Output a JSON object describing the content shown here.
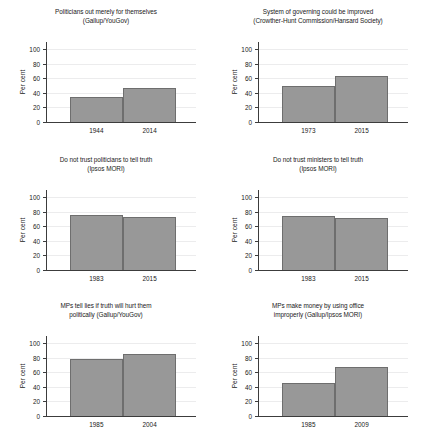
{
  "figure": {
    "axis_label_y": "Per cent",
    "y_ticks": [
      0,
      20,
      40,
      60,
      80,
      100
    ],
    "bar_color": "#989898",
    "bar_edge_color": "#6e6e6e",
    "grid_color": "#ececed",
    "axis_color": "#3c3c3c"
  },
  "chart_data": [
    {
      "type": "bar",
      "title": "Politicians out merely for themselves\n(Gallup/YouGov)",
      "title_line1": "Politicians out merely for themselves",
      "title_line2": "(Gallup/YouGov)",
      "source": "Gallup/YouGov",
      "categories": [
        "1944",
        "2014"
      ],
      "values": [
        35,
        47
      ],
      "xlabel": "",
      "ylabel": "Per cent",
      "ylim": [
        0,
        110
      ],
      "yticks": [
        0,
        20,
        40,
        60,
        80,
        100
      ],
      "grid": true,
      "legend": "none"
    },
    {
      "type": "bar",
      "title": "System of governing could be improved\n(Crowther-Hunt Commission/Hansard Society)",
      "title_line1": "System of governing could be improved",
      "title_line2": "(Crowther-Hunt Commission/Hansard Society)",
      "source": "Crowther-Hunt Commission/Hansard Society",
      "categories": [
        "1973",
        "2015"
      ],
      "values": [
        49,
        63
      ],
      "xlabel": "",
      "ylabel": "Per cent",
      "ylim": [
        0,
        110
      ],
      "yticks": [
        0,
        20,
        40,
        60,
        80,
        100
      ],
      "grid": true,
      "legend": "none"
    },
    {
      "type": "bar",
      "title": "Do not trust politicians to tell truth\n(Ipsos MORI)",
      "title_line1": "Do not trust politicians to tell truth",
      "title_line2": "(Ipsos MORI)",
      "source": "Ipsos MORI",
      "categories": [
        "1983",
        "2015"
      ],
      "values": [
        75,
        73
      ],
      "xlabel": "",
      "ylabel": "Per cent",
      "ylim": [
        0,
        110
      ],
      "yticks": [
        0,
        20,
        40,
        60,
        80,
        100
      ],
      "grid": true,
      "legend": "none"
    },
    {
      "type": "bar",
      "title": "Do not trust ministers to tell truth\n(Ipsos MORI)",
      "title_line1": "Do not trust ministers to tell truth",
      "title_line2": "(Ipsos MORI)",
      "source": "Ipsos MORI",
      "categories": [
        "1983",
        "2015"
      ],
      "values": [
        74,
        72
      ],
      "xlabel": "",
      "ylabel": "Per cent",
      "ylim": [
        0,
        110
      ],
      "yticks": [
        0,
        20,
        40,
        60,
        80,
        100
      ],
      "grid": true,
      "legend": "none"
    },
    {
      "type": "bar",
      "title": "MPs tell lies if truth will hurt them\npolitically (Gallup/YouGov)",
      "title_line1": "MPs tell lies if truth will hurt them",
      "title_line2": "politically (Gallup/YouGov)",
      "source": "Gallup/YouGov",
      "categories": [
        "1985",
        "2004"
      ],
      "values": [
        79,
        85
      ],
      "xlabel": "",
      "ylabel": "Per cent",
      "ylim": [
        0,
        110
      ],
      "yticks": [
        0,
        20,
        40,
        60,
        80,
        100
      ],
      "grid": true,
      "legend": "none"
    },
    {
      "type": "bar",
      "title": "MPs make money by using office\nimproperly (Gallup/Ipsos MORI)",
      "title_line1": "MPs make money by using office",
      "title_line2": "improperly (Gallup/Ipsos MORI)",
      "source": "Gallup/Ipsos MORI",
      "categories": [
        "1985",
        "2009"
      ],
      "values": [
        46,
        68
      ],
      "xlabel": "",
      "ylabel": "Per cent",
      "ylim": [
        0,
        110
      ],
      "yticks": [
        0,
        20,
        40,
        60,
        80,
        100
      ],
      "grid": true,
      "legend": "none"
    }
  ]
}
